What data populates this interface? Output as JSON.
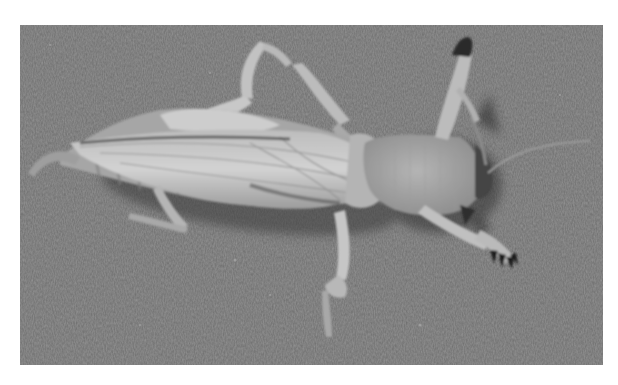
{
  "image": {
    "subject": "mole cricket",
    "description": "Grayscale photograph of a mole cricket viewed from above on a textured gray surface",
    "palette": {
      "background_border": "#ffffff",
      "surface": "#6f6f6f",
      "surface_light": "#7a7a7a",
      "body_light": "#cfcfcf",
      "body_mid": "#a8a8a8",
      "body_dark": "#4a4a4a",
      "claw": "#1e1e1e"
    },
    "frame": {
      "x": 20,
      "y": 25,
      "width": 583,
      "height": 340
    }
  }
}
